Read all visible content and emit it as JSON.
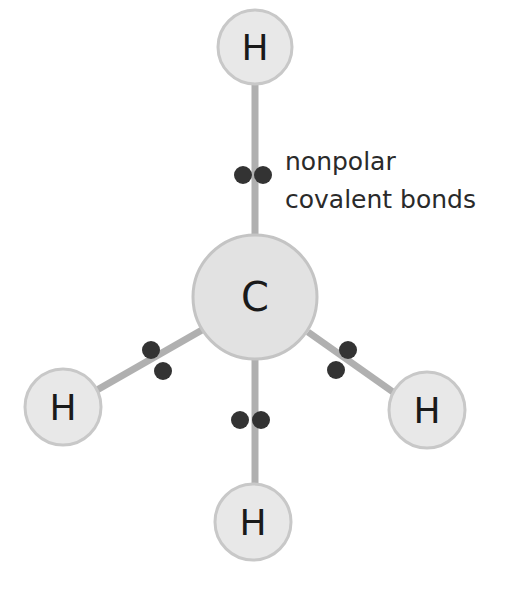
{
  "colors": {
    "atom_fill": "#e2e2e2",
    "atom_stroke": "#c4c4c4",
    "bond": "#b0b0b0",
    "electron": "#333333",
    "text": "#1a1a1a"
  },
  "annotation": {
    "line1": "nonpolar",
    "line2": "covalent bonds"
  },
  "atoms": [
    {
      "id": "C",
      "label": "C",
      "role": "center"
    },
    {
      "id": "H_top",
      "label": "H",
      "role": "top"
    },
    {
      "id": "H_left",
      "label": "H",
      "role": "left"
    },
    {
      "id": "H_right",
      "label": "H",
      "role": "right"
    },
    {
      "id": "H_bottom",
      "label": "H",
      "role": "bottom"
    }
  ],
  "bonds": [
    {
      "from": "C",
      "to": "H_top",
      "shared_electrons": 2
    },
    {
      "from": "C",
      "to": "H_left",
      "shared_electrons": 2
    },
    {
      "from": "C",
      "to": "H_right",
      "shared_electrons": 2
    },
    {
      "from": "C",
      "to": "H_bottom",
      "shared_electrons": 2
    }
  ]
}
